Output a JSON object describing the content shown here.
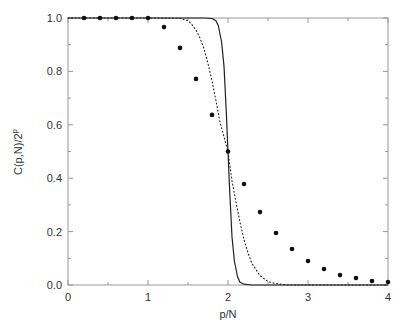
{
  "chart_data": {
    "type": "line",
    "title": "",
    "xlabel": "p/N",
    "ylabel": "C(p,N)/2^p",
    "ylabel_parts": {
      "base": "C(p,N)/2",
      "sup": "p"
    },
    "xlim": [
      0,
      4
    ],
    "ylim": [
      0,
      1.0
    ],
    "xticks": [
      0,
      1,
      2,
      3,
      4
    ],
    "xtick_labels": [
      "0",
      "1",
      "2",
      "3",
      "4"
    ],
    "yticks": [
      0.0,
      0.2,
      0.4,
      0.6,
      0.8,
      1.0
    ],
    "ytick_labels": [
      "0.0",
      "0.2",
      "0.4",
      "0.6",
      "0.8",
      "1.0"
    ],
    "grid": false,
    "legend": null,
    "series": [
      {
        "name": "large N (solid line)",
        "style": "solid",
        "x": [
          0,
          1.0,
          1.7,
          1.8,
          1.85,
          1.88,
          1.92,
          1.95,
          1.98,
          2.0,
          2.02,
          2.05,
          2.08,
          2.12,
          2.15,
          2.2,
          2.3,
          4.0
        ],
        "y": [
          1.0,
          1.0,
          1.0,
          0.998,
          0.99,
          0.97,
          0.91,
          0.82,
          0.64,
          0.5,
          0.36,
          0.18,
          0.09,
          0.03,
          0.01,
          0.003,
          0.0,
          0.0
        ]
      },
      {
        "name": "medium N (dotted line)",
        "style": "dotted",
        "x": [
          0,
          1.0,
          1.4,
          1.5,
          1.55,
          1.6,
          1.65,
          1.7,
          1.75,
          1.8,
          1.85,
          1.9,
          1.95,
          2.0,
          2.05,
          2.1,
          2.15,
          2.2,
          2.25,
          2.3,
          2.4,
          2.5,
          2.6,
          2.7,
          2.8,
          3.0,
          4.0
        ],
        "y": [
          1.0,
          1.0,
          0.999,
          0.99,
          0.975,
          0.955,
          0.925,
          0.885,
          0.83,
          0.765,
          0.69,
          0.61,
          0.555,
          0.5,
          0.39,
          0.31,
          0.235,
          0.17,
          0.12,
          0.08,
          0.035,
          0.013,
          0.005,
          0.002,
          0.0,
          0.0,
          0.0
        ]
      },
      {
        "name": "small N (filled circles)",
        "style": "markers",
        "x": [
          0.2,
          0.4,
          0.6,
          0.8,
          1.0,
          1.2,
          1.4,
          1.6,
          1.8,
          2.0,
          2.2,
          2.4,
          2.6,
          2.8,
          3.0,
          3.2,
          3.4,
          3.6,
          3.8,
          4.0
        ],
        "y": [
          1.0,
          1.0,
          1.0,
          1.0,
          1.0,
          0.966,
          0.888,
          0.772,
          0.637,
          0.5,
          0.378,
          0.273,
          0.195,
          0.135,
          0.09,
          0.06,
          0.037,
          0.026,
          0.015,
          0.011
        ]
      }
    ]
  }
}
